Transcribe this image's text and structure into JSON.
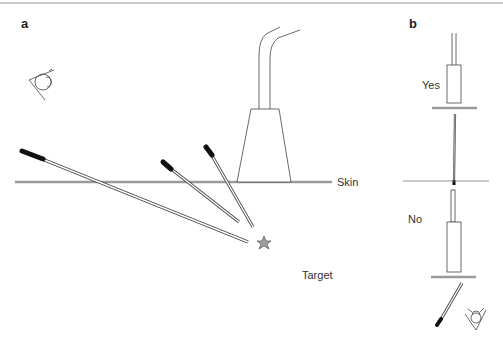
{
  "figure": {
    "panel_a": {
      "label": "a",
      "skin_label": "Skin",
      "target_label": "Target"
    },
    "panel_b": {
      "label": "b",
      "yes_label": "Yes",
      "no_label": "No"
    }
  },
  "colors": {
    "line": "#444444",
    "skin": "#9a9a9a",
    "needle_hub": "#111111",
    "star_fill": "#a0a0a0",
    "frame": "#999999"
  }
}
